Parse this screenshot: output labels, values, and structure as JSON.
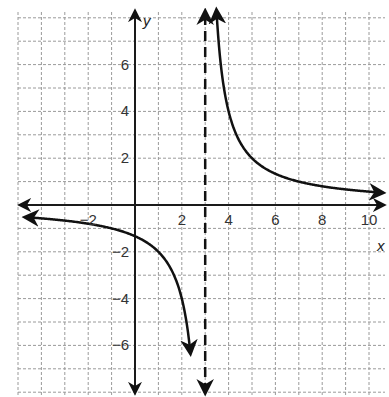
{
  "chart_data": {
    "type": "line",
    "title": "",
    "xlabel": "x",
    "ylabel": "y",
    "xlim": [
      -5,
      10.7
    ],
    "ylim": [
      -8,
      8
    ],
    "grid": true,
    "grid_step": 1,
    "x_ticks": [
      -2,
      2,
      4,
      6,
      8,
      10
    ],
    "y_ticks": [
      -6,
      -4,
      -2,
      2,
      4,
      6
    ],
    "x_tick_labels": [
      "−2",
      "2",
      "4",
      "6",
      "8",
      "10"
    ],
    "y_tick_labels": [
      "−6",
      "−4",
      "−2",
      "2",
      "4",
      "6"
    ],
    "function": "y = 4/(x - 3)",
    "vertical_asymptote": {
      "x": 3,
      "style": "dashed"
    },
    "horizontal_asymptote": {
      "y": 0
    },
    "series": [
      {
        "name": "left branch",
        "points": [
          [
            -4.7,
            -0.52
          ],
          [
            -2,
            -0.8
          ],
          [
            0,
            -1.33
          ],
          [
            1,
            -2
          ],
          [
            2,
            -4
          ],
          [
            2.5,
            -8
          ]
        ]
      },
      {
        "name": "right branch",
        "points": [
          [
            3.5,
            8
          ],
          [
            4,
            4
          ],
          [
            5,
            2
          ],
          [
            6,
            1.33
          ],
          [
            7,
            1
          ],
          [
            8,
            0.8
          ],
          [
            10,
            0.57
          ],
          [
            10.5,
            0.53
          ]
        ]
      }
    ],
    "colors": {
      "curve": "#111111",
      "grid": "#9a9a9a",
      "axes": "#1a1a1a"
    }
  },
  "labels": {
    "x_axis": "x",
    "y_axis": "y"
  }
}
